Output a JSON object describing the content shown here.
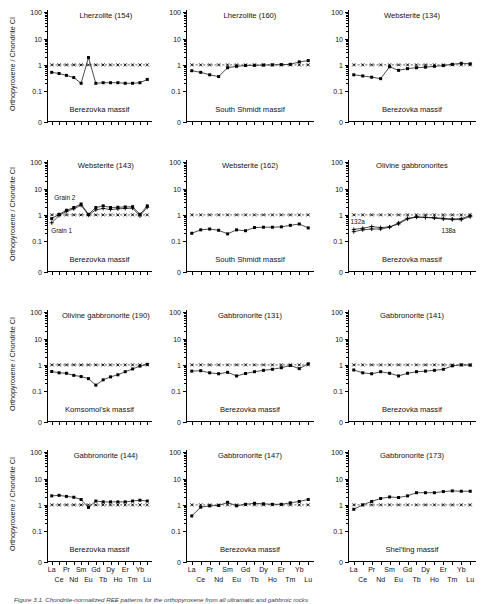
{
  "figure": {
    "caption": "Figure 3.1. Chondrite-normalized REE patterns for the orthopyroxene from all ultramatic and gabbroic rocks",
    "y_axis_title": "Orthopyroxene / Chondrite CI",
    "y_tick_labels": [
      "100",
      "10",
      "1",
      "0.1",
      "0"
    ],
    "x_labels_top": [
      "La",
      "Pr",
      "Sm",
      "Gd",
      "Dy",
      "Er",
      "Yb"
    ],
    "x_labels_bottom": [
      "Ce",
      "Nd",
      "Eu",
      "Tb",
      "Ho",
      "Tm",
      "Lu"
    ],
    "reference_line_label": "chondrite-unity-line"
  },
  "chart_data": [
    {
      "id": "p1",
      "type": "line",
      "title": "Lherzolite (154)",
      "massif": "Berezovka massif",
      "ylabel": "Orthopyroxene / Chondrite CI",
      "xlabel": "",
      "categories": [
        "La",
        "Ce",
        "Pr",
        "Nd",
        "Sm",
        "Eu",
        "Gd",
        "Tb",
        "Dy",
        "Ho",
        "Er",
        "Tm",
        "Yb",
        "Lu"
      ],
      "ylim": [
        0.04,
        100
      ],
      "grid": false,
      "legend": "none",
      "series": [
        {
          "name": "sample 154",
          "marker": "filled-square",
          "values": [
            0.52,
            0.47,
            0.4,
            0.33,
            0.2,
            1.9,
            0.2,
            0.21,
            0.21,
            0.21,
            0.2,
            0.2,
            0.21,
            0.28
          ]
        },
        {
          "name": "chondrite reference",
          "marker": "cross",
          "style": "dashed",
          "values": [
            1,
            1,
            1,
            1,
            1,
            1,
            1,
            1,
            1,
            1,
            1,
            1,
            1,
            1
          ]
        }
      ],
      "annotations": []
    },
    {
      "id": "p2",
      "type": "line",
      "title": "Lherzolite (160)",
      "massif": "South Shmidt massif",
      "ylabel": "",
      "xlabel": "",
      "categories": [
        "La",
        "Ce",
        "Pr",
        "Nd",
        "Sm",
        "Eu",
        "Gd",
        "Tb",
        "Dy",
        "Ho",
        "Er",
        "Tm",
        "Yb",
        "Lu"
      ],
      "ylim": [
        0.04,
        100
      ],
      "grid": false,
      "legend": "none",
      "series": [
        {
          "name": "sample 160",
          "marker": "filled-square",
          "values": [
            0.6,
            0.52,
            0.42,
            0.36,
            0.78,
            0.88,
            0.95,
            0.96,
            0.98,
            1.0,
            1.02,
            1.05,
            1.3,
            1.45
          ]
        },
        {
          "name": "chondrite reference",
          "marker": "cross",
          "style": "dashed",
          "values": [
            1,
            1,
            1,
            1,
            1,
            1,
            1,
            1,
            1,
            1,
            1,
            1,
            1,
            1
          ]
        }
      ],
      "annotations": []
    },
    {
      "id": "p3",
      "type": "line",
      "title": "Websterite (134)",
      "massif": "Berezovka massif",
      "ylabel": "",
      "xlabel": "",
      "categories": [
        "La",
        "Ce",
        "Pr",
        "Nd",
        "Sm",
        "Eu",
        "Gd",
        "Tb",
        "Dy",
        "Ho",
        "Er",
        "Tm",
        "Yb",
        "Lu"
      ],
      "ylim": [
        0.04,
        100
      ],
      "grid": false,
      "legend": "none",
      "series": [
        {
          "name": "sample 134",
          "marker": "filled-square",
          "values": [
            0.42,
            0.38,
            0.34,
            0.3,
            0.85,
            0.62,
            0.72,
            0.78,
            0.82,
            0.88,
            0.94,
            1.05,
            1.15,
            1.1
          ]
        },
        {
          "name": "chondrite reference",
          "marker": "cross",
          "style": "dashed",
          "values": [
            1,
            1,
            1,
            1,
            1,
            1,
            1,
            1,
            1,
            1,
            1,
            1,
            1,
            1
          ]
        }
      ],
      "annotations": []
    },
    {
      "id": "p4",
      "type": "line",
      "title": "Websterite (143)",
      "massif": "Berezovka massif",
      "ylabel": "Orthopyroxene / Chondrite CI",
      "xlabel": "",
      "categories": [
        "La",
        "Ce",
        "Pr",
        "Nd",
        "Sm",
        "Eu",
        "Gd",
        "Tb",
        "Dy",
        "Ho",
        "Er",
        "Tm",
        "Yb",
        "Lu"
      ],
      "ylim": [
        0.04,
        100
      ],
      "grid": false,
      "legend": "inline-labels",
      "series": [
        {
          "name": "Grain 2",
          "marker": "filled-square",
          "values": [
            0.72,
            1.05,
            1.5,
            1.9,
            2.6,
            1.05,
            1.9,
            2.2,
            1.9,
            1.95,
            2.0,
            2.05,
            1.05,
            2.2
          ]
        },
        {
          "name": "Grain 1",
          "marker": "cross-bold",
          "values": [
            0.5,
            0.95,
            1.35,
            1.7,
            2.3,
            0.98,
            1.55,
            1.75,
            1.6,
            1.7,
            1.75,
            1.8,
            0.92,
            1.95
          ]
        },
        {
          "name": "chondrite reference",
          "marker": "cross",
          "style": "dashed",
          "values": [
            1,
            1,
            1,
            1,
            1,
            1,
            1,
            1,
            1,
            1,
            1,
            1,
            1,
            1
          ]
        }
      ],
      "annotations": [
        {
          "text": "Grain 2",
          "x": 0.07,
          "y": 0.3
        },
        {
          "text": "Grain 1",
          "x": 0.04,
          "y": 0.6
        }
      ]
    },
    {
      "id": "p5",
      "type": "line",
      "title": "Websterite (162)",
      "massif": "South Shmidt massif",
      "ylabel": "",
      "xlabel": "",
      "categories": [
        "La",
        "Ce",
        "Pr",
        "Nd",
        "Sm",
        "Eu",
        "Gd",
        "Tb",
        "Dy",
        "Ho",
        "Er",
        "Tm",
        "Yb",
        "Lu"
      ],
      "ylim": [
        0.04,
        100
      ],
      "grid": false,
      "legend": "none",
      "series": [
        {
          "name": "sample 162",
          "marker": "filled-square",
          "values": [
            0.2,
            0.27,
            0.29,
            0.26,
            0.19,
            0.27,
            0.25,
            0.33,
            0.34,
            0.34,
            0.35,
            0.4,
            0.45,
            0.32
          ]
        },
        {
          "name": "chondrite reference",
          "marker": "cross",
          "style": "dashed",
          "values": [
            1,
            1,
            1,
            1,
            1,
            1,
            1,
            1,
            1,
            1,
            1,
            1,
            1,
            1
          ]
        }
      ],
      "annotations": []
    },
    {
      "id": "p6",
      "type": "line",
      "title": "Olivine gabbronorites",
      "massif": "Berezovka massif",
      "ylabel": "",
      "xlabel": "",
      "categories": [
        "La",
        "Ce",
        "Pr",
        "Nd",
        "Sm",
        "Eu",
        "Gd",
        "Tb",
        "Dy",
        "Ho",
        "Er",
        "Tm",
        "Yb",
        "Lu"
      ],
      "ylim": [
        0.04,
        100
      ],
      "grid": false,
      "legend": "inline-labels",
      "series": [
        {
          "name": "132a",
          "marker": "cross-bold",
          "values": [
            0.28,
            0.31,
            0.36,
            0.33,
            0.35,
            0.45,
            0.7,
            0.82,
            0.8,
            0.78,
            0.74,
            0.7,
            0.72,
            0.95
          ]
        },
        {
          "name": "138a",
          "marker": "cross-bold",
          "values": [
            0.23,
            0.27,
            0.29,
            0.29,
            0.34,
            0.5,
            0.74,
            0.84,
            0.8,
            0.76,
            0.7,
            0.66,
            0.66,
            0.85
          ]
        },
        {
          "name": "chondrite reference",
          "marker": "cross",
          "style": "dashed",
          "values": [
            1,
            1,
            1,
            1,
            1,
            1,
            1,
            1,
            1,
            1,
            1,
            1,
            1,
            1
          ]
        }
      ],
      "annotations": [
        {
          "text": "132a",
          "x": 0.02,
          "y": 0.52
        },
        {
          "text": "138a",
          "x": 0.73,
          "y": 0.6
        }
      ]
    },
    {
      "id": "p7",
      "type": "line",
      "title": "Olivine gabbronorite (190)",
      "massif": "Komsomol'sk massif",
      "ylabel": "Orthopyroxene / Chondrite CI",
      "xlabel": "",
      "categories": [
        "La",
        "Ce",
        "Pr",
        "Nd",
        "Sm",
        "Eu",
        "Gd",
        "Tb",
        "Dy",
        "Ho",
        "Er",
        "Tm",
        "Yb",
        "Lu"
      ],
      "ylim": [
        0.04,
        100
      ],
      "grid": false,
      "legend": "none",
      "series": [
        {
          "name": "sample 190",
          "marker": "filled-square",
          "values": [
            0.56,
            0.5,
            0.48,
            0.4,
            0.36,
            0.3,
            0.17,
            0.27,
            0.35,
            0.42,
            0.55,
            0.7,
            0.9,
            1.05
          ]
        },
        {
          "name": "chondrite reference",
          "marker": "cross",
          "style": "dashed",
          "values": [
            1,
            1,
            1,
            1,
            1,
            1,
            1,
            1,
            1,
            1,
            1,
            1,
            1,
            1
          ]
        }
      ],
      "annotations": []
    },
    {
      "id": "p8",
      "type": "line",
      "title": "Gabbronorite (131)",
      "massif": "Berezovka massif",
      "ylabel": "",
      "xlabel": "",
      "categories": [
        "La",
        "Ce",
        "Pr",
        "Nd",
        "Sm",
        "Eu",
        "Gd",
        "Tb",
        "Dy",
        "Ho",
        "Er",
        "Tm",
        "Yb",
        "Lu"
      ],
      "ylim": [
        0.04,
        100
      ],
      "grid": false,
      "legend": "none",
      "series": [
        {
          "name": "sample 131",
          "marker": "filled-square",
          "values": [
            0.58,
            0.6,
            0.5,
            0.46,
            0.52,
            0.38,
            0.47,
            0.55,
            0.62,
            0.68,
            0.78,
            0.95,
            0.72,
            1.1
          ]
        },
        {
          "name": "chondrite reference",
          "marker": "cross",
          "style": "dashed",
          "values": [
            1,
            1,
            1,
            1,
            1,
            1,
            1,
            1,
            1,
            1,
            1,
            1,
            1,
            1
          ]
        }
      ],
      "annotations": []
    },
    {
      "id": "p9",
      "type": "line",
      "title": "Gabbronorite (141)",
      "massif": "Berezovka massif",
      "ylabel": "",
      "xlabel": "",
      "categories": [
        "La",
        "Ce",
        "Pr",
        "Nd",
        "Sm",
        "Eu",
        "Gd",
        "Tb",
        "Dy",
        "Ho",
        "Er",
        "Tm",
        "Yb",
        "Lu"
      ],
      "ylim": [
        0.04,
        100
      ],
      "grid": false,
      "legend": "none",
      "series": [
        {
          "name": "sample 141",
          "marker": "filled-square",
          "values": [
            0.64,
            0.5,
            0.46,
            0.55,
            0.48,
            0.38,
            0.48,
            0.55,
            0.58,
            0.62,
            0.68,
            0.92,
            1.0,
            0.98
          ]
        },
        {
          "name": "chondrite reference",
          "marker": "cross",
          "style": "dashed",
          "values": [
            1,
            1,
            1,
            1,
            1,
            1,
            1,
            1,
            1,
            1,
            1,
            1,
            1,
            1
          ]
        }
      ],
      "annotations": []
    },
    {
      "id": "p10",
      "type": "line",
      "title": "Gabbronorite (144)",
      "massif": "Berezovka massif",
      "ylabel": "Orthopyroxene / Chondrite CI",
      "xlabel": "",
      "categories": [
        "La",
        "Ce",
        "Pr",
        "Nd",
        "Sm",
        "Eu",
        "Gd",
        "Tb",
        "Dy",
        "Ho",
        "Er",
        "Tm",
        "Yb",
        "Lu"
      ],
      "ylim": [
        0.04,
        100
      ],
      "grid": false,
      "legend": "none",
      "series": [
        {
          "name": "sample 144",
          "marker": "filled-square",
          "values": [
            2.2,
            2.3,
            2.1,
            1.95,
            1.6,
            0.8,
            1.4,
            1.3,
            1.3,
            1.3,
            1.3,
            1.4,
            1.5,
            1.4
          ]
        },
        {
          "name": "chondrite reference",
          "marker": "cross",
          "style": "dashed",
          "values": [
            1,
            1,
            1,
            1,
            1,
            1,
            1,
            1,
            1,
            1,
            1,
            1,
            1,
            1
          ]
        }
      ],
      "annotations": []
    },
    {
      "id": "p11",
      "type": "line",
      "title": "Gabbronorite (147)",
      "massif": "Berezovka massif",
      "ylabel": "",
      "xlabel": "",
      "categories": [
        "La",
        "Ce",
        "Pr",
        "Nd",
        "Sm",
        "Eu",
        "Gd",
        "Tb",
        "Dy",
        "Ho",
        "Er",
        "Tm",
        "Yb",
        "Lu"
      ],
      "ylim": [
        0.04,
        100
      ],
      "grid": false,
      "legend": "none",
      "series": [
        {
          "name": "sample 147",
          "marker": "filled-square",
          "values": [
            0.38,
            0.82,
            0.92,
            0.95,
            1.25,
            0.92,
            1.05,
            1.15,
            1.1,
            1.05,
            1.05,
            1.2,
            1.35,
            1.6
          ]
        },
        {
          "name": "chondrite reference",
          "marker": "cross",
          "style": "dashed",
          "values": [
            1,
            1,
            1,
            1,
            1,
            1,
            1,
            1,
            1,
            1,
            1,
            1,
            1,
            1
          ]
        }
      ],
      "annotations": []
    },
    {
      "id": "p12",
      "type": "line",
      "title": "Gabbronorite (173)",
      "massif": "Shel'ting massif",
      "ylabel": "",
      "xlabel": "",
      "categories": [
        "La",
        "Ce",
        "Pr",
        "Nd",
        "Sm",
        "Eu",
        "Gd",
        "Tb",
        "Dy",
        "Ho",
        "Er",
        "Tm",
        "Yb",
        "Lu"
      ],
      "ylim": [
        0.04,
        100
      ],
      "grid": false,
      "legend": "none",
      "series": [
        {
          "name": "sample 173",
          "marker": "filled-square",
          "values": [
            0.68,
            1.0,
            1.35,
            1.75,
            2.0,
            1.9,
            2.2,
            2.9,
            2.9,
            2.9,
            3.2,
            3.4,
            3.3,
            3.3
          ]
        },
        {
          "name": "chondrite reference",
          "marker": "cross",
          "style": "dashed",
          "values": [
            1,
            1,
            1,
            1,
            1,
            1,
            1,
            1,
            1,
            1,
            1,
            1,
            1,
            1
          ]
        }
      ],
      "annotations": []
    }
  ]
}
